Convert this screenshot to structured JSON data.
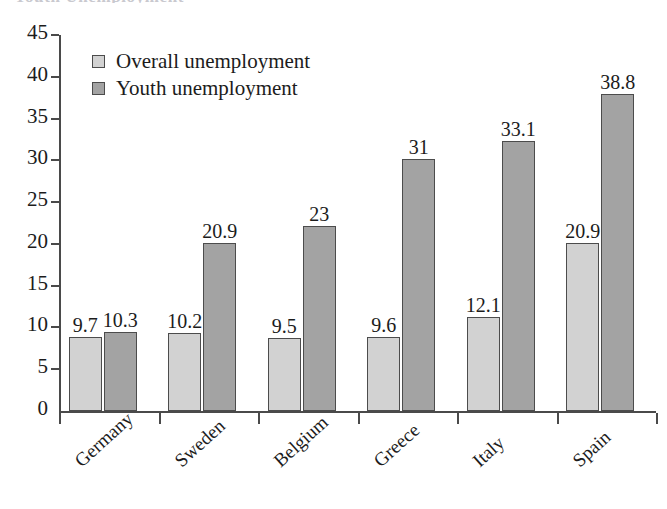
{
  "top_sliver_text": "Youth Unemployment",
  "legend": {
    "position": "inside-top-left",
    "items": [
      {
        "label": "Overall unemployment",
        "color": "#d2d2d2",
        "key": "overall"
      },
      {
        "label": "Youth unemployment",
        "color": "#a3a3a3",
        "key": "youth"
      }
    ]
  },
  "chart_data": {
    "type": "bar",
    "title": "",
    "xlabel": "",
    "ylabel": "",
    "ylim": [
      0,
      45
    ],
    "ytick_step": 5,
    "yticks": [
      45,
      40,
      35,
      30,
      25,
      20,
      15,
      10,
      5,
      0
    ],
    "grid": false,
    "legend_position": "inside-top-left",
    "categories": [
      "Germany",
      "Sweden",
      "Belgium",
      "Greece",
      "Italy",
      "Spain"
    ],
    "series": [
      {
        "name": "Overall unemployment",
        "color": "#d2d2d2",
        "values": [
          9.7,
          10.2,
          9.5,
          9.6,
          12.1,
          20.9
        ],
        "labels": [
          "9.7",
          "10.2",
          "9.5",
          "9.6",
          "12.1",
          "20.9"
        ],
        "plotted_heights": [
          8.8,
          9.3,
          8.7,
          8.8,
          11.2,
          20.1
        ]
      },
      {
        "name": "Youth unemployment",
        "color": "#a3a3a3",
        "values": [
          10.3,
          20.9,
          23,
          31,
          33.1,
          38.8
        ],
        "labels": [
          "10.3",
          "20.9",
          "23",
          "31",
          "33.1",
          "38.8"
        ],
        "plotted_heights": [
          9.5,
          20.1,
          22.2,
          30.2,
          32.3,
          38.0
        ]
      }
    ]
  }
}
